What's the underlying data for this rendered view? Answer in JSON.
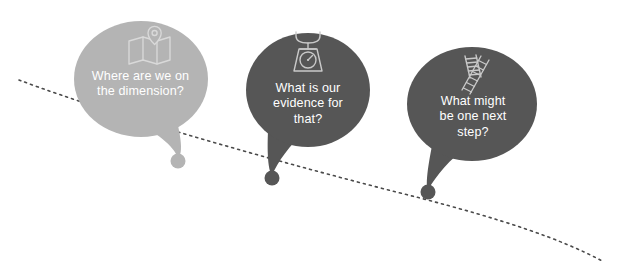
{
  "diagram": {
    "background_color": "#ffffff",
    "path": {
      "name": "dotted-trajectory",
      "style": "dotted",
      "color": "#4a4a4a",
      "dash": "2 4"
    },
    "bubbles": [
      {
        "id": "bubble-1",
        "text": "Where are we on\nthe dimension?",
        "text_color": "#ffffff",
        "fill_color": "#b4b4b4",
        "icon": "folded-map-pin-icon",
        "icon_color": "#d4d4d4",
        "cx": 141,
        "cy": 79,
        "rx": 67,
        "ry": 58,
        "dot": {
          "x": 178,
          "y": 161,
          "r": 7.5,
          "color": "#b4b4b4"
        }
      },
      {
        "id": "bubble-2",
        "text": "What is our\nevidence for\nthat?",
        "text_color": "#ffffff",
        "fill_color": "#565656",
        "icon": "kitchen-scale-icon",
        "icon_color": "#c9c9c9",
        "cx": 308,
        "cy": 90,
        "rx": 62,
        "ry": 57,
        "dot": {
          "x": 272,
          "y": 178,
          "r": 7.5,
          "color": "#565656"
        }
      },
      {
        "id": "bubble-3",
        "text": "What might\nbe one next\nstep?",
        "text_color": "#ffffff",
        "fill_color": "#565656",
        "icon": "bent-ladder-icon",
        "icon_color": "#c9c9c9",
        "cx": 472,
        "cy": 104,
        "rx": 65,
        "ry": 57,
        "dot": {
          "x": 428,
          "y": 192,
          "r": 7.5,
          "color": "#565656"
        }
      }
    ]
  }
}
